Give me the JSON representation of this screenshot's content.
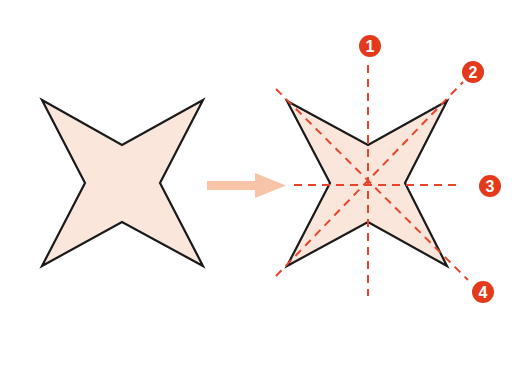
{
  "diagram": {
    "colors": {
      "shape_fill": "#fbe6dc",
      "outline": "#1a1a1a",
      "axis": "#e8442a",
      "badge": "#e33a1c",
      "arrow": "#f8c4a8"
    },
    "left_shape": {
      "label": "four-pointed star"
    },
    "arrow": {
      "label": "transform-arrow"
    },
    "right_shape": {
      "label": "four-pointed star with symmetry axes"
    },
    "axes": [
      {
        "number": "1",
        "orientation": "vertical"
      },
      {
        "number": "2",
        "orientation": "diagonal ascending"
      },
      {
        "number": "3",
        "orientation": "horizontal"
      },
      {
        "number": "4",
        "orientation": "diagonal descending"
      }
    ]
  }
}
